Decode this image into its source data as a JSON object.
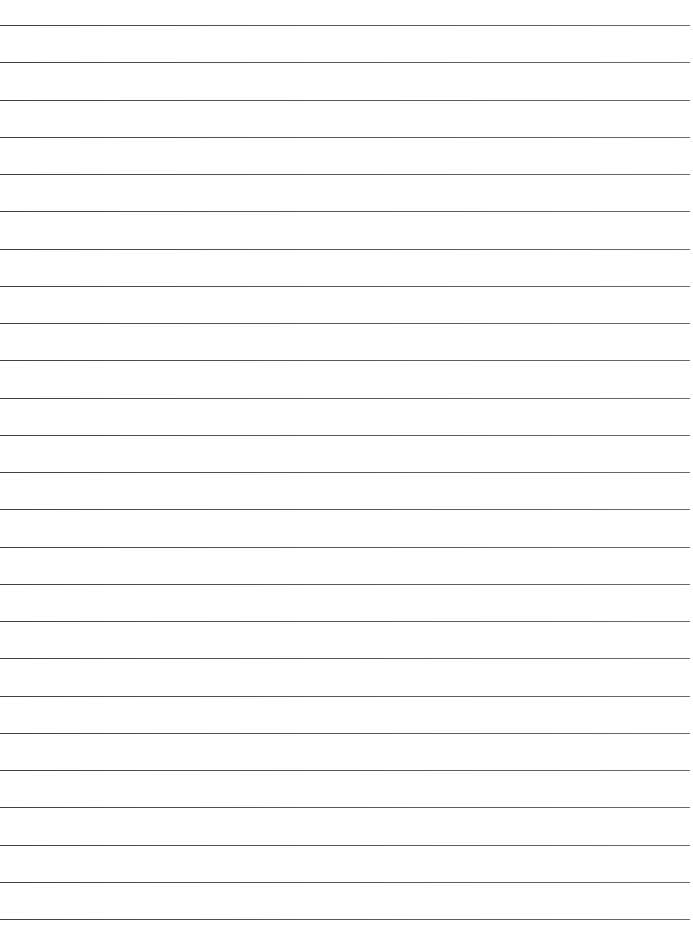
{
  "document": {
    "kind": "ruled-paper-scan",
    "title": "Blank ruled writing paper",
    "page_width": 693,
    "page_height": 928,
    "background_color": "#ffffff",
    "is_blank": true,
    "handwriting_present": false,
    "printed_text_present": false,
    "margin_rule_present": false,
    "hole_punches_present": false
  },
  "ruling": {
    "line_color": "#4a4a4a",
    "line_thickness_px": 1,
    "line_count": 25,
    "first_line_y": 25,
    "line_spacing_px": 37.25,
    "line_start_x": 0,
    "line_end_x": 690,
    "orientation": "horizontal",
    "lines": [
      {
        "index": 1,
        "y": 25,
        "x_start": 0,
        "x_end": 690,
        "text": ""
      },
      {
        "index": 2,
        "y": 62,
        "x_start": 0,
        "x_end": 690,
        "text": ""
      },
      {
        "index": 3,
        "y": 100,
        "x_start": 0,
        "x_end": 690,
        "text": ""
      },
      {
        "index": 4,
        "y": 137,
        "x_start": 0,
        "x_end": 690,
        "text": ""
      },
      {
        "index": 5,
        "y": 174,
        "x_start": 0,
        "x_end": 690,
        "text": ""
      },
      {
        "index": 6,
        "y": 211,
        "x_start": 0,
        "x_end": 690,
        "text": ""
      },
      {
        "index": 7,
        "y": 249,
        "x_start": 0,
        "x_end": 690,
        "text": ""
      },
      {
        "index": 8,
        "y": 286,
        "x_start": 0,
        "x_end": 690,
        "text": ""
      },
      {
        "index": 9,
        "y": 323,
        "x_start": 0,
        "x_end": 690,
        "text": ""
      },
      {
        "index": 10,
        "y": 360,
        "x_start": 0,
        "x_end": 690,
        "text": ""
      },
      {
        "index": 11,
        "y": 398,
        "x_start": 0,
        "x_end": 690,
        "text": ""
      },
      {
        "index": 12,
        "y": 435,
        "x_start": 0,
        "x_end": 690,
        "text": ""
      },
      {
        "index": 13,
        "y": 472,
        "x_start": 0,
        "x_end": 690,
        "text": ""
      },
      {
        "index": 14,
        "y": 509,
        "x_start": 0,
        "x_end": 690,
        "text": ""
      },
      {
        "index": 15,
        "y": 547,
        "x_start": 0,
        "x_end": 690,
        "text": ""
      },
      {
        "index": 16,
        "y": 584,
        "x_start": 0,
        "x_end": 690,
        "text": ""
      },
      {
        "index": 17,
        "y": 621,
        "x_start": 0,
        "x_end": 690,
        "text": ""
      },
      {
        "index": 18,
        "y": 658,
        "x_start": 0,
        "x_end": 690,
        "text": ""
      },
      {
        "index": 19,
        "y": 696,
        "x_start": 0,
        "x_end": 690,
        "text": ""
      },
      {
        "index": 20,
        "y": 733,
        "x_start": 0,
        "x_end": 690,
        "text": ""
      },
      {
        "index": 21,
        "y": 770,
        "x_start": 0,
        "x_end": 690,
        "text": ""
      },
      {
        "index": 22,
        "y": 807,
        "x_start": 0,
        "x_end": 690,
        "text": ""
      },
      {
        "index": 23,
        "y": 845,
        "x_start": 0,
        "x_end": 690,
        "text": ""
      },
      {
        "index": 24,
        "y": 882,
        "x_start": 0,
        "x_end": 690,
        "text": ""
      },
      {
        "index": 25,
        "y": 919,
        "x_start": 0,
        "x_end": 690,
        "text": ""
      }
    ]
  }
}
